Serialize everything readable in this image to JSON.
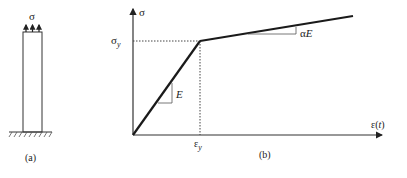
{
  "panel_a": {
    "load_label": "σ",
    "caption": "(a)"
  },
  "panel_b": {
    "y_axis_label": "σ",
    "x_axis_label": "ε(t)",
    "yield_stress_label": "σ",
    "yield_stress_sub": "y",
    "yield_strain_label": "ε",
    "yield_strain_sub": "y",
    "elastic_slope_label": "E",
    "hardening_slope_label": "αE",
    "caption": "(b)"
  },
  "colors": {
    "line": "#1a1a1a",
    "thin": "#333333"
  }
}
